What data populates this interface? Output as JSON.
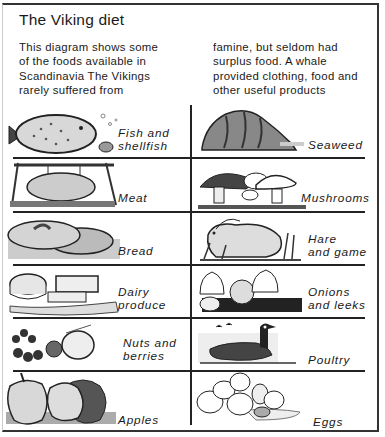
{
  "title": "The Viking diet",
  "intro": {
    "left_lines": [
      "This diagram shows some",
      "of the foods available in",
      "Scandinavia  The Vikings",
      "rarely suffered from"
    ],
    "right_lines": [
      "famine, but seldom had",
      "surplus food. A whale",
      "provided clothing, food and",
      "other useful products"
    ]
  },
  "foods": {
    "left": [
      {
        "lines": [
          "Fish and",
          "shellfish"
        ],
        "icon": "flatfish-icon"
      },
      {
        "lines": [
          "Meat"
        ],
        "icon": "roast-pig-icon"
      },
      {
        "lines": [
          "Bread"
        ],
        "icon": "flatbread-icon"
      },
      {
        "lines": [
          "Dairy",
          "produce"
        ],
        "icon": "cheese-icon"
      },
      {
        "lines": [
          "Nuts and",
          "berries"
        ],
        "icon": "berries-icon"
      },
      {
        "lines": [
          "Apples"
        ],
        "icon": "apples-icon"
      }
    ],
    "right": [
      {
        "lines": [
          "Seaweed"
        ],
        "icon": "seaweed-rock-icon"
      },
      {
        "lines": [
          "Mushrooms"
        ],
        "icon": "mushrooms-icon"
      },
      {
        "lines": [
          "Hare",
          "and game"
        ],
        "icon": "hare-icon"
      },
      {
        "lines": [
          "Onions",
          "and leeks"
        ],
        "icon": "onions-leeks-icon"
      },
      {
        "lines": [
          "Poultry"
        ],
        "icon": "goose-icon"
      },
      {
        "lines": [
          "Eggs"
        ],
        "icon": "eggs-icon"
      }
    ]
  }
}
